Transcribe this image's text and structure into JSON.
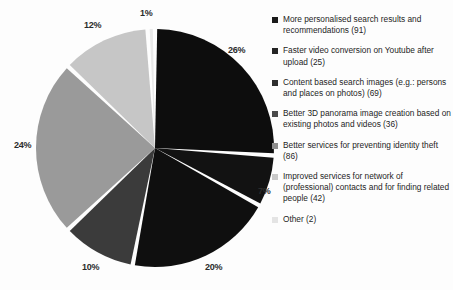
{
  "chart_data": {
    "type": "pie",
    "title": "",
    "subtitle": "",
    "xlabel": "",
    "ylabel": "",
    "grid": false,
    "legend_position": "right",
    "start_angle_deg": 0,
    "direction": "clockwise",
    "categories": [
      "More personalised  search results and recommendations (91)",
      "Faster video conversion on Youtube after upload (25)",
      "Content based search images (e.g.: persons and places on photos) (69)",
      "Better 3D panorama image creation based on existing photos and videos (36)",
      "Better services for preventing identity theft (86)",
      "Improved services for network of (professional) contacts and for finding related people (42)",
      "Other (2)"
    ],
    "values": [
      26,
      7,
      20,
      10,
      24,
      12,
      1
    ],
    "counts": [
      91,
      25,
      69,
      36,
      86,
      42,
      2
    ],
    "data_labels": [
      "26%",
      "7%",
      "20%",
      "10%",
      "24%",
      "12%",
      "1%"
    ],
    "colors": [
      "#0d0d0d",
      "#121212",
      "#0f0f0f",
      "#3b3b3b",
      "#9a9a9a",
      "#c6c6c6",
      "#e9e9e9"
    ],
    "slice_gap_color": "#ffffff"
  },
  "pie": {
    "labels": [
      {
        "text": "1%",
        "x": 140,
        "y": 8,
        "name": "pie-label-other"
      },
      {
        "text": "26%",
        "x": 228,
        "y": 45,
        "name": "pie-label-personalised-search"
      },
      {
        "text": "7%",
        "x": 258,
        "y": 186,
        "name": "pie-label-video-conversion"
      },
      {
        "text": "20%",
        "x": 205,
        "y": 262,
        "name": "pie-label-content-based-search"
      },
      {
        "text": "10%",
        "x": 82,
        "y": 262,
        "name": "pie-label-3d-panorama"
      },
      {
        "text": "24%",
        "x": 14,
        "y": 140,
        "name": "pie-label-identity-theft"
      },
      {
        "text": "12%",
        "x": 84,
        "y": 20,
        "name": "pie-label-network-contacts"
      }
    ]
  },
  "legend": {
    "items": [
      {
        "label": "More personalised  search results and recommendations (91)",
        "color": "#1a1a1a"
      },
      {
        "label": "Faster video conversion on Youtube after upload (25)",
        "color": "#242424"
      },
      {
        "label": "Content based search images (e.g.: persons and places on photos) (69)",
        "color": "#2e2e2e"
      },
      {
        "label": "Better 3D panorama image creation based on existing photos and videos (36)",
        "color": "#4a4a4a"
      },
      {
        "label": "Better services for preventing identity theft (86)",
        "color": "#8e8e8e"
      },
      {
        "label": "Improved services for network of (professional) contacts and for finding related people (42)",
        "color": "#c9c9c9"
      },
      {
        "label": "Other (2)",
        "color": "#e4e4e4"
      }
    ]
  }
}
